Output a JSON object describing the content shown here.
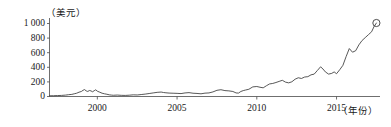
{
  "chart_data": {
    "type": "line",
    "title": "",
    "subtitle": "",
    "xlabel": "（年份）",
    "ylabel": "（美元）",
    "xlim": [
      1997,
      2017.6
    ],
    "ylim": [
      0,
      1060
    ],
    "grid": false,
    "legend": null,
    "y_ticks": [
      0,
      200,
      400,
      600,
      800,
      1000
    ],
    "y_tick_labels": [
      "0",
      "200",
      "400",
      "600",
      "800",
      "1 000"
    ],
    "x_ticks": [
      2000,
      2005,
      2010,
      2015
    ],
    "x_tick_labels": [
      "2000",
      "2005",
      "2010",
      "2015"
    ],
    "series": [
      {
        "name": "股价",
        "marker_end": true,
        "x": [
          1997.0,
          1997.25,
          1997.5,
          1997.75,
          1998.0,
          1998.2,
          1998.4,
          1998.55,
          1998.7,
          1998.85,
          1999.0,
          1999.1,
          1999.2,
          1999.3,
          1999.4,
          1999.5,
          1999.6,
          1999.7,
          1999.8,
          1999.9,
          2000.0,
          2000.15,
          2000.3,
          2000.45,
          2000.6,
          2000.75,
          2000.9,
          2001.0,
          2001.25,
          2001.5,
          2001.75,
          2002.0,
          2002.25,
          2002.5,
          2002.75,
          2003.0,
          2003.25,
          2003.5,
          2003.75,
          2004.0,
          2004.15,
          2004.3,
          2004.5,
          2004.75,
          2005.0,
          2005.25,
          2005.5,
          2005.75,
          2006.0,
          2006.25,
          2006.5,
          2006.75,
          2007.0,
          2007.25,
          2007.5,
          2007.75,
          2008.0,
          2008.25,
          2008.5,
          2008.7,
          2008.85,
          2009.0,
          2009.15,
          2009.3,
          2009.5,
          2009.75,
          2010.0,
          2010.2,
          2010.4,
          2010.6,
          2010.8,
          2011.0,
          2011.2,
          2011.4,
          2011.6,
          2011.8,
          2012.0,
          2012.2,
          2012.4,
          2012.6,
          2012.8,
          2013.0,
          2013.2,
          2013.4,
          2013.6,
          2013.8,
          2014.0,
          2014.15,
          2014.3,
          2014.5,
          2014.7,
          2014.85,
          2015.0,
          2015.2,
          2015.4,
          2015.6,
          2015.8,
          2016.0,
          2016.2,
          2016.4,
          2016.6,
          2016.8,
          2017.0,
          2017.2,
          2017.35,
          2017.5
        ],
        "y": [
          3,
          4,
          6,
          8,
          12,
          18,
          22,
          30,
          38,
          52,
          62,
          78,
          88,
          70,
          62,
          75,
          70,
          58,
          72,
          85,
          66,
          52,
          38,
          30,
          24,
          16,
          12,
          10,
          13,
          9,
          8,
          11,
          16,
          14,
          20,
          26,
          34,
          42,
          50,
          54,
          48,
          44,
          40,
          38,
          36,
          33,
          42,
          46,
          38,
          35,
          30,
          39,
          42,
          56,
          78,
          86,
          74,
          70,
          62,
          42,
          40,
          62,
          74,
          82,
          92,
          125,
          130,
          120,
          112,
          140,
          165,
          172,
          185,
          200,
          215,
          190,
          180,
          195,
          230,
          250,
          240,
          260,
          265,
          290,
          300,
          350,
          400,
          370,
          330,
          300,
          310,
          330,
          305,
          360,
          420,
          540,
          650,
          600,
          620,
          700,
          760,
          800,
          840,
          880,
          950,
          1000
        ]
      }
    ]
  },
  "axis": {
    "y_unit_label": "（美元）",
    "x_unit_label": "（年份）"
  },
  "colors": {
    "line": "#3a3a3a",
    "axis": "#4a4a4a",
    "text": "#1a1a1a",
    "background": "#ffffff"
  }
}
